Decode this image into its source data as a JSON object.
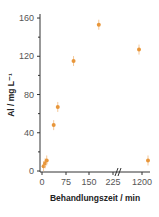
{
  "chart_data": {
    "type": "scatter",
    "title": "",
    "xlabel": "Behandlungszeit / min",
    "ylabel": "Al / mg L⁻¹",
    "x_ticks": [
      "0",
      "75",
      "150",
      "225",
      "1200"
    ],
    "y_ticks": [
      "0",
      "40",
      "80",
      "120",
      "160"
    ],
    "ylim": [
      0,
      165
    ],
    "axis_break": "between 225 and 1200",
    "series": [
      {
        "name": "Al",
        "color": "#e8963a",
        "x": [
          5,
          10,
          15,
          37,
          50,
          100,
          180,
          1140,
          1320
        ],
        "y": [
          5,
          8,
          11,
          48,
          67,
          115,
          153,
          127,
          11
        ]
      }
    ],
    "grid": false,
    "legend": "none"
  }
}
